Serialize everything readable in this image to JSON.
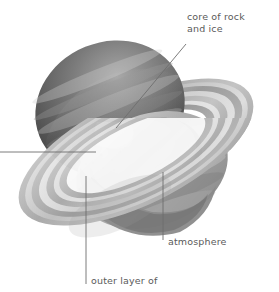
{
  "figure": {
    "kind": "cutaway-diagram",
    "background_color": "#ffffff",
    "width": 279,
    "height": 292
  },
  "labels": {
    "core": {
      "line1": "core of rock",
      "line2": "and ice",
      "text": "core of rock\nand ice",
      "color": "#5a5a5a",
      "leader": "diagonal from text down-left to white core wedge"
    },
    "atmosphere": {
      "text": "atmosphere",
      "color": "#5a5a5a",
      "leader": "vertical line up into planet body"
    },
    "outer_layer": {
      "text": "outer layer of",
      "color": "#5a5a5a",
      "leader": "vertical line up into planet interior",
      "note": "text clipped at bottom edge of image"
    },
    "left_cropped": {
      "text": "",
      "color": "#5a5a5a",
      "leader": "horizontal line exiting left edge of image, label text cropped out of frame"
    }
  },
  "palette": {
    "background": "#ffffff",
    "sphere_dark": "#4b4b4b",
    "sphere_mid": "#8b8b8b",
    "sphere_light": "#c9c9c9",
    "ring_dark": "#8f8f8f",
    "ring_mid": "#b4b4b4",
    "ring_light": "#e3e3e3",
    "core_white": "#ffffff",
    "leader_line": "#6e6e6e",
    "text": "#5a5a5a"
  }
}
